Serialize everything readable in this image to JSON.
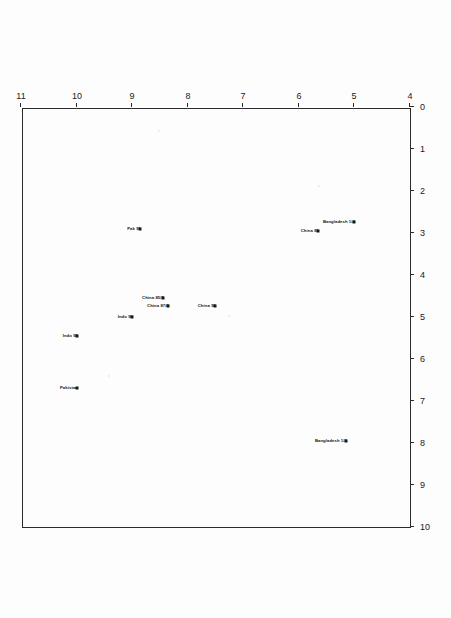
{
  "chart_data": {
    "type": "scatter",
    "title": "",
    "xlabel": "",
    "ylabel": "Poverty Incidence (Under $21 pcm)",
    "xlim": [
      4,
      11
    ],
    "ylim": [
      0,
      10
    ],
    "xticks": [
      4,
      5,
      6,
      7,
      8,
      9,
      10,
      11
    ],
    "xtick_labels": [
      "4",
      "5",
      "6",
      "7",
      "8",
      "9",
      "10",
      "11"
    ],
    "yticks": [
      0,
      1,
      2,
      3,
      4,
      5,
      6,
      7,
      8,
      9,
      10
    ],
    "ytick_labels": [
      "0",
      "1",
      "2",
      "3",
      "4",
      "5",
      "6",
      "7",
      "8",
      "9",
      "10"
    ],
    "grid": false,
    "legend": "none",
    "rotation_note": "figure scanned upside-down (180 degrees)",
    "points": [
      {
        "label": "Pakistan",
        "x": 10.0,
        "y": 6.7
      },
      {
        "label": "Indo 95",
        "x": 10.0,
        "y": 5.45
      },
      {
        "label": "Indo 90",
        "x": 9.0,
        "y": 5.0
      },
      {
        "label": "Pak 91",
        "x": 8.85,
        "y": 2.9
      },
      {
        "label": "China 87/8",
        "x": 8.35,
        "y": 4.75
      },
      {
        "label": "China 85/9",
        "x": 8.45,
        "y": 4.55
      },
      {
        "label": "China 95",
        "x": 7.5,
        "y": 4.75
      },
      {
        "label": "China 81",
        "x": 5.65,
        "y": 2.95
      },
      {
        "label": "Bangladesh 1/2",
        "x": 5.15,
        "y": 7.95
      },
      {
        "label": "Bangladesh 1/4",
        "x": 5.0,
        "y": 2.75
      }
    ]
  },
  "axis": {
    "y_title": "Poverty Incidence (Under $21 pcm)"
  }
}
